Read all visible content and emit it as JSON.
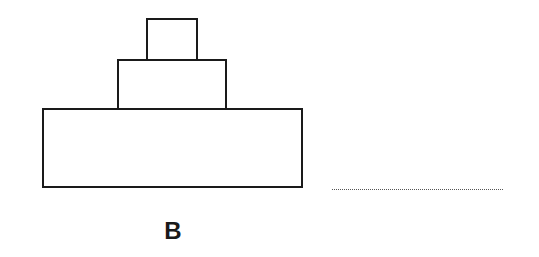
{
  "figure": {
    "label": "B",
    "shapes": [
      {
        "name": "base-rectangle",
        "left": 42,
        "top": 108,
        "width": 261,
        "height": 80
      },
      {
        "name": "middle-rectangle",
        "left": 117,
        "top": 59,
        "width": 110,
        "height": 51
      },
      {
        "name": "top-rectangle",
        "left": 146,
        "top": 18,
        "width": 52,
        "height": 43
      }
    ],
    "answer_line": "dotted"
  }
}
